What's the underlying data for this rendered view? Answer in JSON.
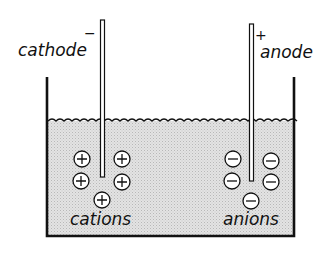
{
  "diagram": {
    "type": "electrolysis-cell",
    "electrodes": {
      "cathode": {
        "label": "cathode",
        "sign": "−"
      },
      "anode": {
        "label": "anode",
        "sign": "+"
      }
    },
    "ions": {
      "cations": {
        "label": "cations",
        "symbol": "+",
        "count": 5
      },
      "anions": {
        "label": "anions",
        "symbol": "−",
        "count": 5
      }
    },
    "colors": {
      "ink": "#111111",
      "solution": "#d9d9d9",
      "background": "#ffffff"
    }
  }
}
